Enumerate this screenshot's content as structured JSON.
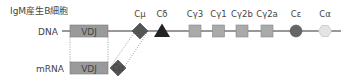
{
  "title": "IgM産生B細胞",
  "rows": {
    "dna": {
      "label": "DNA"
    },
    "mrna": {
      "label": "mRNA"
    }
  },
  "segments": {
    "vdj_dna": {
      "label": "VDJ"
    },
    "vdj_mrna": {
      "label": "VDJ"
    },
    "c_mu_mrna": {
      "label": "Cμ"
    }
  },
  "constant_regions": [
    {
      "id": "c-mu",
      "label": "Cμ",
      "shape": "diamond",
      "color": "#555555"
    },
    {
      "id": "c-delta",
      "label": "Cδ",
      "shape": "triangle",
      "color": "#222222"
    },
    {
      "id": "c-gamma3",
      "label": "Cγ3",
      "shape": "square",
      "color": "#aaaaaa"
    },
    {
      "id": "c-gamma1",
      "label": "Cγ1",
      "shape": "square",
      "color": "#aaaaaa"
    },
    {
      "id": "c-gamma2b",
      "label": "Cγ2b",
      "shape": "square",
      "color": "#aaaaaa"
    },
    {
      "id": "c-gamma2a",
      "label": "Cγ2a",
      "shape": "square",
      "color": "#aaaaaa"
    },
    {
      "id": "c-epsilon",
      "label": "Cε",
      "shape": "circle",
      "color": "#666666"
    },
    {
      "id": "c-alpha",
      "label": "Cα",
      "shape": "hexagon",
      "color": "#e4e4e4"
    }
  ],
  "colors": {
    "vdj_fill": "#9a9a9a",
    "line": "#333333",
    "dotted": "#777777"
  }
}
